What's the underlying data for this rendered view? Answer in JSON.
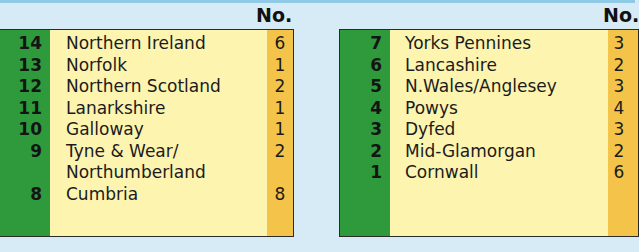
{
  "header": {
    "no_label": "No."
  },
  "left_table": {
    "rows": [
      {
        "rank": "14",
        "name": "Northern Ireland",
        "no": "6"
      },
      {
        "rank": "13",
        "name": "Norfolk",
        "no": "1"
      },
      {
        "rank": "12",
        "name": "Northern Scotland",
        "no": "2"
      },
      {
        "rank": "11",
        "name": "Lanarkshire",
        "no": "1"
      },
      {
        "rank": "10",
        "name": "Galloway",
        "no": "1"
      },
      {
        "rank": "9",
        "name": "Tyne & Wear/",
        "no": "2"
      },
      {
        "rank": "",
        "name": "Northumberland",
        "no": ""
      },
      {
        "rank": "8",
        "name": "Cumbria",
        "no": "8"
      }
    ]
  },
  "right_table": {
    "rows": [
      {
        "rank": "7",
        "name": "Yorks Pennines",
        "no": "3"
      },
      {
        "rank": "6",
        "name": "Lancashire",
        "no": "2"
      },
      {
        "rank": "5",
        "name": "N.Wales/Anglesey",
        "no": "3"
      },
      {
        "rank": "4",
        "name": "Powys",
        "no": "4"
      },
      {
        "rank": "3",
        "name": "Dyfed",
        "no": "3"
      },
      {
        "rank": "2",
        "name": "Mid-Glamorgan",
        "no": "2"
      },
      {
        "rank": "1",
        "name": "Cornwall",
        "no": "6"
      }
    ]
  },
  "colors": {
    "green": "#2e9a3c",
    "yellow": "#fdf4b0",
    "orange": "#f4c349",
    "background": "#d6ebf5"
  }
}
